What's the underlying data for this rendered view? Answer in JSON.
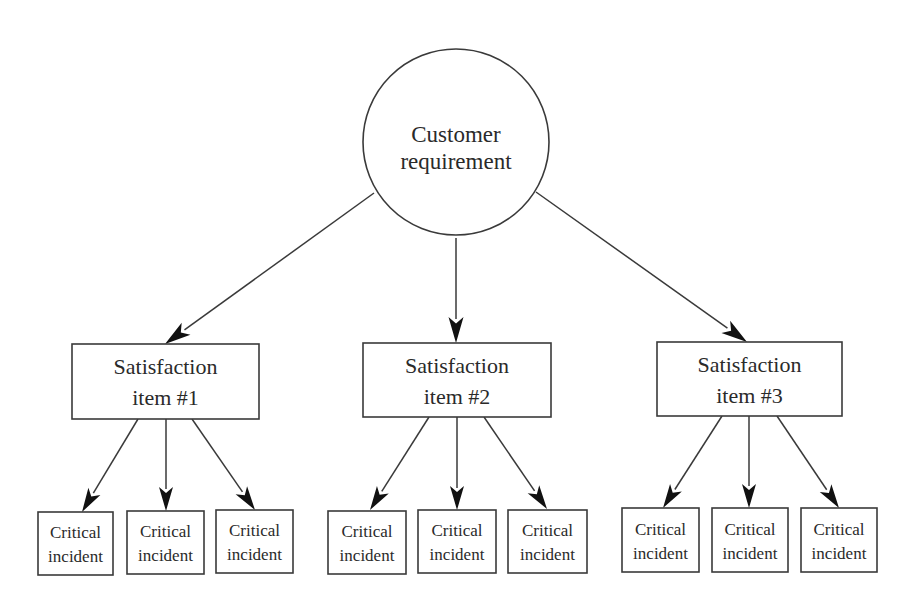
{
  "diagram": {
    "colors": {
      "stroke": "#3a3a3a",
      "arrow": "#111111",
      "text": "#2a2a2a",
      "background": "#ffffff"
    },
    "root": {
      "shape": "circle",
      "lines": [
        "Customer",
        "requirement"
      ],
      "cx": 456,
      "cy": 142,
      "r": 93
    },
    "items": [
      {
        "lines": [
          "Satisfaction",
          "item #1"
        ],
        "box": {
          "x": 72,
          "y": 344,
          "w": 187,
          "h": 75
        },
        "edge_from_root": {
          "x1": 374,
          "y1": 193,
          "x2": 165,
          "y2": 344
        },
        "incidents": [
          {
            "lines": [
              "Critical",
              "incident"
            ],
            "box": {
              "x": 38,
              "y": 512,
              "w": 75,
              "h": 63
            },
            "edge": {
              "x1": 138,
              "y1": 419,
              "x2": 82,
              "y2": 512
            }
          },
          {
            "lines": [
              "Critical",
              "incident"
            ],
            "box": {
              "x": 127,
              "y": 511,
              "w": 77,
              "h": 63
            },
            "edge": {
              "x1": 166,
              "y1": 419,
              "x2": 166,
              "y2": 511
            }
          },
          {
            "lines": [
              "Critical",
              "incident"
            ],
            "box": {
              "x": 216,
              "y": 510,
              "w": 77,
              "h": 63
            },
            "edge": {
              "x1": 192,
              "y1": 419,
              "x2": 255,
              "y2": 510
            }
          }
        ]
      },
      {
        "lines": [
          "Satisfaction",
          "item #2"
        ],
        "box": {
          "x": 363,
          "y": 343,
          "w": 188,
          "h": 74
        },
        "edge_from_root": {
          "x1": 456,
          "y1": 238,
          "x2": 456,
          "y2": 343
        },
        "incidents": [
          {
            "lines": [
              "Critical",
              "incident"
            ],
            "box": {
              "x": 328,
              "y": 511,
              "w": 78,
              "h": 63
            },
            "edge": {
              "x1": 429,
              "y1": 417,
              "x2": 370,
              "y2": 510
            }
          },
          {
            "lines": [
              "Critical",
              "incident"
            ],
            "box": {
              "x": 418,
              "y": 510,
              "w": 78,
              "h": 63
            },
            "edge": {
              "x1": 457,
              "y1": 417,
              "x2": 457,
              "y2": 510
            }
          },
          {
            "lines": [
              "Critical",
              "incident"
            ],
            "box": {
              "x": 508,
              "y": 510,
              "w": 79,
              "h": 63
            },
            "edge": {
              "x1": 484,
              "y1": 417,
              "x2": 547,
              "y2": 509
            }
          }
        ]
      },
      {
        "lines": [
          "Satisfaction",
          "item #3"
        ],
        "box": {
          "x": 657,
          "y": 342,
          "w": 185,
          "h": 74
        },
        "edge_from_root": {
          "x1": 536,
          "y1": 192,
          "x2": 747,
          "y2": 342
        },
        "incidents": [
          {
            "lines": [
              "Critical",
              "incident"
            ],
            "box": {
              "x": 622,
              "y": 508,
              "w": 77,
              "h": 64
            },
            "edge": {
              "x1": 722,
              "y1": 416,
              "x2": 663,
              "y2": 508
            }
          },
          {
            "lines": [
              "Critical",
              "incident"
            ],
            "box": {
              "x": 712,
              "y": 508,
              "w": 76,
              "h": 64
            },
            "edge": {
              "x1": 749,
              "y1": 416,
              "x2": 749,
              "y2": 508
            }
          },
          {
            "lines": [
              "Critical",
              "incident"
            ],
            "box": {
              "x": 801,
              "y": 508,
              "w": 76,
              "h": 64
            },
            "edge": {
              "x1": 777,
              "y1": 416,
              "x2": 839,
              "y2": 508
            }
          }
        ]
      }
    ]
  }
}
